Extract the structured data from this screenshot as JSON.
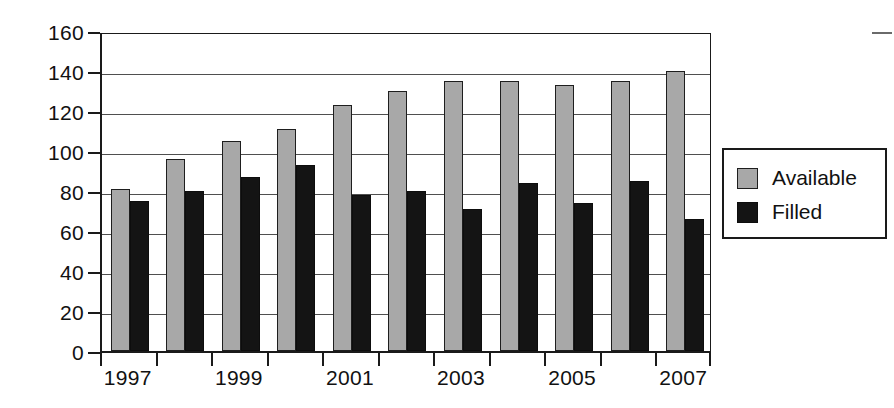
{
  "chart_data": {
    "type": "bar",
    "title": "",
    "subtitle": "",
    "xlabel": "",
    "ylabel": "",
    "categories": [
      "1997",
      "1998",
      "1999",
      "2000",
      "2001",
      "2002",
      "2003",
      "2004",
      "2005",
      "2006",
      "2007"
    ],
    "x_tick_labels": [
      "1997",
      "1999",
      "2001",
      "2003",
      "2005",
      "2007"
    ],
    "x_tick_label_categories": [
      "1997",
      "1999",
      "2001",
      "2003",
      "2005",
      "2007"
    ],
    "series": [
      {
        "name": "Available",
        "color": "#a8a8a8",
        "values": [
          81,
          96,
          105,
          111,
          123,
          130,
          135,
          135,
          133,
          135,
          140
        ]
      },
      {
        "name": "Filled",
        "color": "#141414",
        "values": [
          75,
          80,
          87,
          93,
          78,
          80,
          71,
          84,
          74,
          85,
          66
        ]
      }
    ],
    "ylim": [
      0,
      160
    ],
    "y_ticks": [
      0,
      20,
      40,
      60,
      80,
      100,
      120,
      140,
      160
    ],
    "y_tick_labels": [
      "0",
      "20",
      "40",
      "60",
      "80",
      "100",
      "120",
      "140",
      "160"
    ],
    "grid": true,
    "grid_axis": "y",
    "legend_position": "right",
    "bar_count_per_group": 2
  },
  "legend": {
    "entries": [
      {
        "label": "Available",
        "swatch": "gray-swatch"
      },
      {
        "label": "Filled",
        "swatch": "black-swatch"
      }
    ]
  }
}
